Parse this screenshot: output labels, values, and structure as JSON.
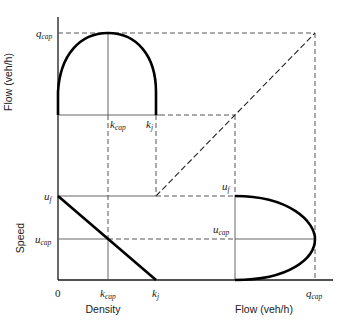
{
  "figure": {
    "panels": [
      {
        "name": "flow-density",
        "ylabel": "Flow (veh/h)",
        "xlabel": ""
      },
      {
        "name": "speed-density",
        "ylabel": "Speed",
        "xlabel": "Density"
      },
      {
        "name": "speed-flow",
        "ylabel": "",
        "xlabel": "Flow (veh/h)"
      }
    ],
    "labels": {
      "flow_axis_label": "Flow (veh/h)",
      "speed_axis_label": "Speed",
      "density_axis_label": "Density",
      "flow_xaxis_label": "Flow (veh/h)",
      "origin": "0",
      "q": "q",
      "cap": "cap",
      "k": "k",
      "j": "j",
      "u": "u",
      "f": "f"
    },
    "symbols": {
      "q_cap": "q_cap",
      "k_cap": "k_cap",
      "k_j": "k_j",
      "u_f": "u_f",
      "u_cap": "u_cap"
    },
    "colors": {
      "curve": "#000000",
      "axis": "#1a1a1a",
      "guide": "#555555"
    }
  }
}
